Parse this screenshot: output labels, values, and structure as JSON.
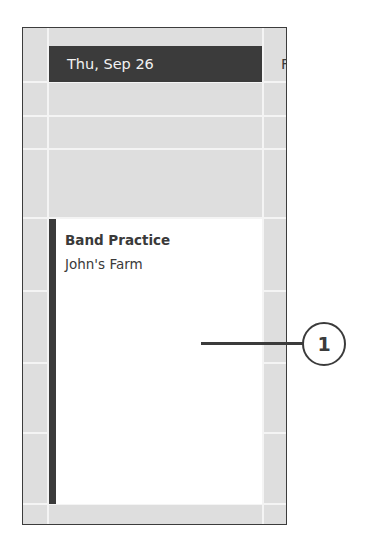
{
  "calendar": {
    "day_header": "Thu, Sep 26",
    "next_day_header": "Fri",
    "colors": {
      "header_bg": "#3b3b3b",
      "grid_bg": "#dedede",
      "gridline": "#f4f4f4",
      "event_bg": "#ffffff",
      "event_accent": "#3b3b3b"
    },
    "gridlines_y": [
      54,
      88,
      121,
      191,
      263,
      335,
      405,
      476
    ],
    "event": {
      "title": "Band Practice",
      "location": "John's Farm"
    }
  },
  "callout": {
    "number": "1"
  }
}
